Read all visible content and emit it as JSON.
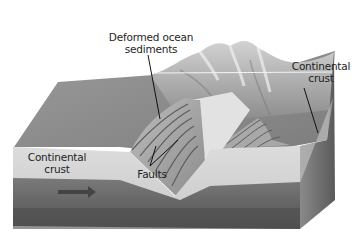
{
  "diagram": {
    "labels": {
      "deformed_sediments": {
        "line1": "Deformed ocean",
        "line2": "sediments"
      },
      "continental_crust_right": {
        "line1": "Continental",
        "line2": "crust"
      },
      "continental_crust_left": {
        "line1": "Continental",
        "line2": "crust"
      },
      "faults": "Faults"
    },
    "colors": {
      "surface": "#8a8a8a",
      "mountains": "#b8b8b8",
      "crust_layer": "#d6d6d6",
      "mantle_layer": "#6e6e6e",
      "mantle_deep": "#4e4e4e",
      "side_face": "#7a7a7a",
      "leader_line": "#111111"
    },
    "arrow": {
      "direction": "right",
      "meaning": "plate motion"
    }
  }
}
